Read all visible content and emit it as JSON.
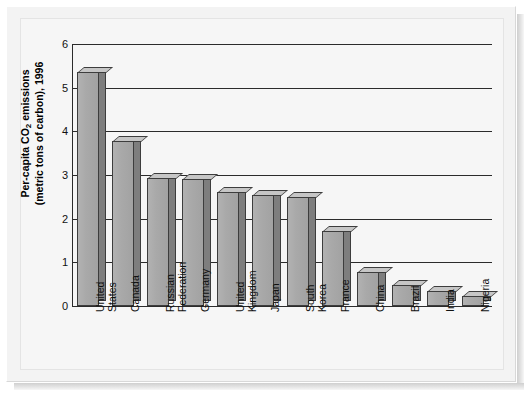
{
  "chart_data": {
    "type": "bar",
    "title": "",
    "subtitle": "",
    "xlabel": "",
    "ylabel": "Per-capita CO2 emissions\n(metric tons of carbon), 1996",
    "ylabel_line1": "Per-capita CO",
    "ylabel_sub": "2",
    "ylabel_line1_rest": " emissions",
    "ylabel_line2": "(metric tons of carbon), 1996",
    "ylim": [
      0,
      6
    ],
    "ytick_values": [
      0,
      1,
      2,
      3,
      4,
      5,
      6
    ],
    "ytick_labels": [
      "0",
      "1",
      "2",
      "3",
      "4",
      "5",
      "6"
    ],
    "grid": true,
    "legend": false,
    "legend_position": "none",
    "categories": [
      "United\nStates",
      "Canada",
      "Russian\nFederation",
      "Germany",
      "United\nKingdom",
      "Japan",
      "South\nKorea",
      "France",
      "China",
      "Brazil",
      "India",
      "Nigeria"
    ],
    "values": [
      5.35,
      3.78,
      2.93,
      2.9,
      2.6,
      2.55,
      2.49,
      1.72,
      0.78,
      0.49,
      0.34,
      0.23
    ],
    "series": [
      {
        "name": "Per-capita CO2 emissions",
        "values": [
          5.35,
          3.78,
          2.93,
          2.9,
          2.6,
          2.55,
          2.49,
          1.72,
          0.78,
          0.49,
          0.34,
          0.23
        ]
      }
    ],
    "bar_style": "3d-shaded",
    "colors": {
      "bar_front": "#a9a9a9",
      "bar_side": "#7e7e7e",
      "bar_top": "#c6c6c6",
      "bar_outline": "#3d3d3d",
      "grid": "#2b2b2b",
      "axis": "#2b2b2b",
      "plot_background": "#f6f6f6",
      "frame_background": "#f3f3f3",
      "text": "#111111"
    }
  }
}
